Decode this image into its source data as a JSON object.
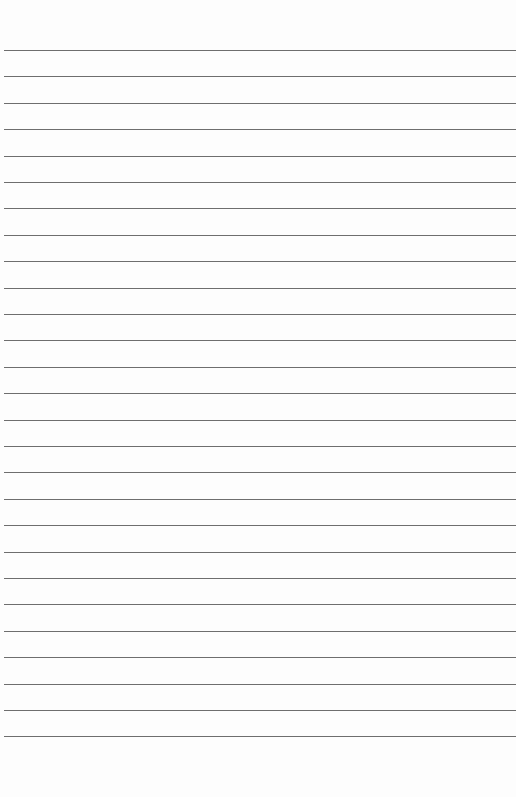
{
  "page": {
    "type": "ruled-paper",
    "background_color": "#fdfdfd",
    "line_color": "#6e6e6e",
    "line_count": 27,
    "first_line_y": 50,
    "line_spacing": 26.4
  }
}
